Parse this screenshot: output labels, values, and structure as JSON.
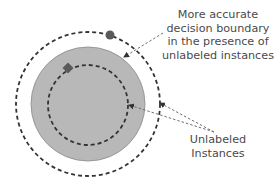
{
  "annotations": {
    "boundary_note": {
      "lines": [
        "More accurate",
        "decision boundary",
        "in the presence of",
        "unlabeled instances"
      ]
    },
    "unlabeled_note": {
      "lines": [
        "Unlabeled",
        "Instances"
      ]
    }
  },
  "elements": {
    "outer_boundary": {
      "style": "dashed",
      "color": "#333333"
    },
    "labeled_region": {
      "fill": "#b8b8b8",
      "stroke": "#8a8a8a"
    },
    "inner_boundary": {
      "style": "dashed",
      "color": "#333333"
    },
    "markers": [
      {
        "shape": "circle",
        "color": "#5a5a5a"
      },
      {
        "shape": "diamond",
        "color": "#5a5a5a"
      }
    ],
    "arrow_color": "#707070"
  }
}
